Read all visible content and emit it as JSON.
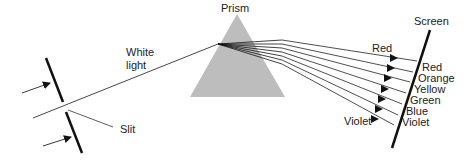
{
  "labels": {
    "prism": "Prism",
    "screen": "Screen",
    "white_light_line1": "White",
    "white_light_line2": "light",
    "slit": "Slit",
    "ray_top": "Red",
    "ray_bottom": "Violet"
  },
  "spectrum": [
    "Red",
    "Orange",
    "Yellow",
    "Green",
    "Blue",
    "Violet"
  ],
  "colors": {
    "prism_fill": "#bdbdbd",
    "line": "#222222",
    "background": "#ffffff"
  }
}
